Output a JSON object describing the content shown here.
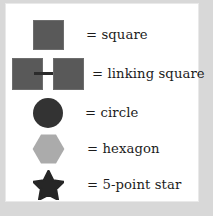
{
  "figure": {
    "background_color": "#d8d8d8",
    "panel_color": "#ffffff"
  },
  "legend": {
    "rows": [
      {
        "glyph": "square-glyph",
        "label": "= square",
        "color": "#595959"
      },
      {
        "glyph": "linking-square-glyph",
        "label": "= linking square",
        "color": "#595959",
        "link_color": "#2b2b2b"
      },
      {
        "glyph": "circle-glyph",
        "label": "= circle",
        "color": "#333333"
      },
      {
        "glyph": "hexagon-glyph",
        "label": "= hexagon",
        "color": "#ababab"
      },
      {
        "glyph": "star-glyph",
        "label": "= 5-point star",
        "color": "#262626"
      }
    ]
  }
}
